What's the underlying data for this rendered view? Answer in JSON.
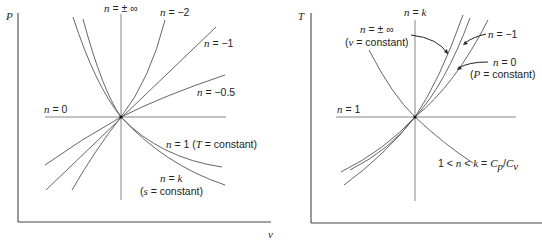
{
  "left_plot": {
    "y_axis_label": "P",
    "x_axis_label": "v",
    "labels": {
      "n_inf_var": "n",
      "n_inf_val": " = ± ∞",
      "n_m2_var": "n",
      "n_m2_val": " = −2",
      "n_m1_var": "n",
      "n_m1_val": " = −1",
      "n_m05_var": "n",
      "n_m05_val": " = −0.5",
      "n_0_var": "n",
      "n_0_val": " = 0",
      "n_1_var": "n",
      "n_1_val": " = 1 (",
      "n_1_T": "T",
      "n_1_rest": " = constant)",
      "n_k_line1_var": "n",
      "n_k_line1_eq": " = ",
      "n_k_line1_k": "k",
      "n_k_line2_open": "(",
      "n_k_line2_s": "s",
      "n_k_line2_rest": " = constant)"
    }
  },
  "right_plot": {
    "y_axis_label": "T",
    "labels": {
      "n_k_var": "n",
      "n_k_eq": " = ",
      "n_k_k": "k",
      "n_inf_var": "n",
      "n_inf_val": " = ± ∞",
      "n_inf_line2_open": "(",
      "n_inf_line2_v": "v",
      "n_inf_line2_rest": " = constant)",
      "n_m1_var": "n",
      "n_m1_val": " = −1",
      "n_0_var": "n",
      "n_0_val": " = 0",
      "n_0_line2_open": "(",
      "n_0_line2_P": "P",
      "n_0_line2_rest": " = constant)",
      "n_1_var": "n",
      "n_1_val": " = 1",
      "range_pre": "1 < ",
      "range_n": "n",
      "range_mid": " < ",
      "range_k": "k",
      "range_eq": " = ",
      "range_Cp": "C",
      "range_p": "p",
      "range_slash": "/",
      "range_Cv": "C",
      "range_v": "v"
    }
  }
}
